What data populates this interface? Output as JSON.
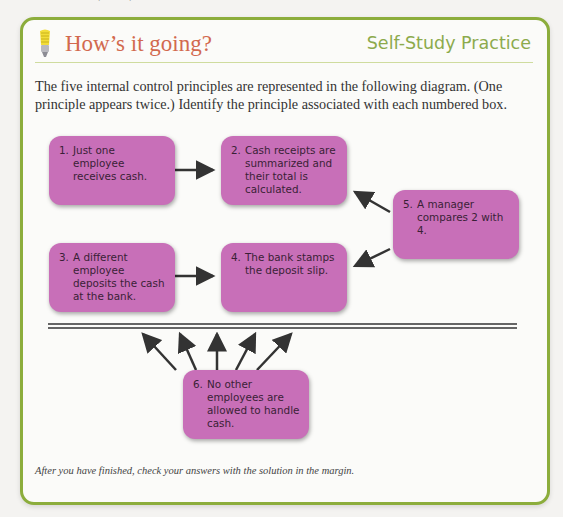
{
  "page": {
    "top_cut_text": "Internal Control, Cash, and Merchandise Sales"
  },
  "header": {
    "icon": "lightbulb-icon",
    "title": "How’s it going?",
    "section_label": "Self-Study Practice"
  },
  "intro": "The five internal control principles are represented in the following diagram. (One principle appears twice.) Identify the principle associated with each numbered box.",
  "diagram": {
    "box_color": "#c86fb8",
    "boxes": [
      {
        "num": "1.",
        "text": "Just one employee receives cash."
      },
      {
        "num": "2.",
        "text": "Cash receipts are summarized and their total is calculated."
      },
      {
        "num": "3.",
        "text": "A different employee deposits the cash at the bank."
      },
      {
        "num": "4.",
        "text": "The bank stamps the deposit slip."
      },
      {
        "num": "5.",
        "text": "A manager compares 2 with 4."
      },
      {
        "num": "6.",
        "text": "No other employees are allowed to handle cash."
      }
    ]
  },
  "footer": "After you have finished, check your answers with the solution in the margin.",
  "colors": {
    "border": "#8cad3c",
    "title": "#d2694e",
    "section_label": "#8caa4c"
  }
}
